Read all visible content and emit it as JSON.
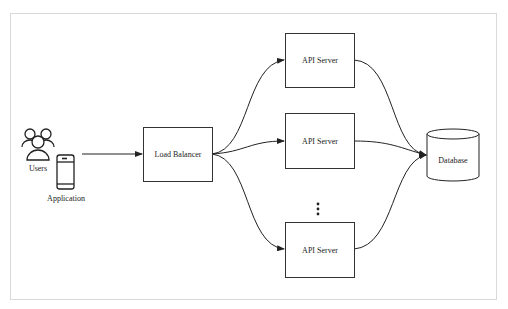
{
  "diagram": {
    "actors": {
      "users_label": "Users",
      "application_label": "Application"
    },
    "load_balancer": {
      "label": "Load Balancer"
    },
    "api_servers": [
      {
        "label": "API Server"
      },
      {
        "label": "API Server"
      },
      {
        "label": "API Server"
      }
    ],
    "ellipsis": "⋮",
    "database": {
      "label": "Database"
    },
    "colors": {
      "stroke": "#333333",
      "frame": "#d9d9d9",
      "background": "#ffffff"
    }
  }
}
